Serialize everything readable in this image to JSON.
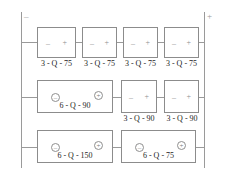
{
  "diagram": {
    "type": "battery-bank-wiring-schematic",
    "terminals": {
      "negative": "–",
      "positive": "+"
    },
    "polarity_glyphs": {
      "minus": "–",
      "plus": "+",
      "minus_circled": "–",
      "plus_circled": "+"
    },
    "colors": {
      "wire": "#9a9a9a",
      "box_border": "#8c8c8c",
      "label_text": "#1d1d1d",
      "glyph": "#8f8f8f",
      "background": "#ffffff"
    },
    "branches": [
      {
        "name": "branch-1",
        "cells": [
          {
            "name": "cell-1-1",
            "label": "3 - Q - 75",
            "style": "small"
          },
          {
            "name": "cell-1-2",
            "label": "3 - Q - 75",
            "style": "small"
          },
          {
            "name": "cell-1-3",
            "label": "3 - Q - 75",
            "style": "small"
          },
          {
            "name": "cell-1-4",
            "label": "3 - Q - 75",
            "style": "small"
          }
        ]
      },
      {
        "name": "branch-2",
        "cells": [
          {
            "name": "cell-2-1",
            "label": "6 - Q - 90",
            "style": "wide"
          },
          {
            "name": "cell-2-2",
            "label": "3 - Q - 90",
            "style": "small"
          },
          {
            "name": "cell-2-3",
            "label": "3 - Q - 90",
            "style": "small"
          }
        ]
      },
      {
        "name": "branch-3",
        "cells": [
          {
            "name": "cell-3-1",
            "label": "6 - Q - 150",
            "style": "wide"
          },
          {
            "name": "cell-3-2",
            "label": "6 - Q - 75",
            "style": "wide"
          }
        ]
      }
    ]
  }
}
